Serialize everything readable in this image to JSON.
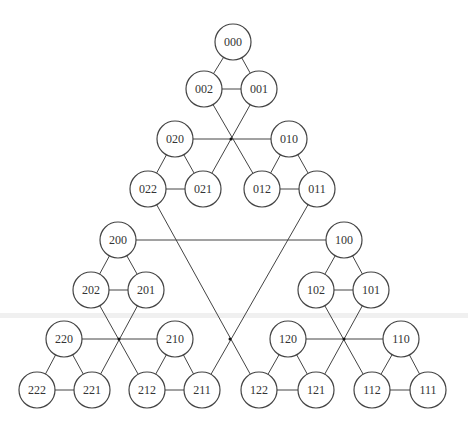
{
  "diagram": {
    "type": "graph",
    "title": "",
    "node_radius": 18,
    "nodes": [
      {
        "id": "000",
        "x": 233,
        "y": 42
      },
      {
        "id": "002",
        "x": 204,
        "y": 89
      },
      {
        "id": "001",
        "x": 259,
        "y": 89
      },
      {
        "id": "020",
        "x": 175,
        "y": 139
      },
      {
        "id": "010",
        "x": 289,
        "y": 139
      },
      {
        "id": "022",
        "x": 148,
        "y": 189
      },
      {
        "id": "021",
        "x": 203,
        "y": 189
      },
      {
        "id": "012",
        "x": 262,
        "y": 189
      },
      {
        "id": "011",
        "x": 317,
        "y": 189
      },
      {
        "id": "200",
        "x": 118,
        "y": 240
      },
      {
        "id": "100",
        "x": 344,
        "y": 240
      },
      {
        "id": "202",
        "x": 91,
        "y": 290
      },
      {
        "id": "201",
        "x": 146,
        "y": 290
      },
      {
        "id": "102",
        "x": 316,
        "y": 290
      },
      {
        "id": "101",
        "x": 371,
        "y": 290
      },
      {
        "id": "220",
        "x": 64,
        "y": 339
      },
      {
        "id": "210",
        "x": 175,
        "y": 339
      },
      {
        "id": "120",
        "x": 288,
        "y": 339
      },
      {
        "id": "110",
        "x": 401,
        "y": 339
      },
      {
        "id": "222",
        "x": 37,
        "y": 390
      },
      {
        "id": "221",
        "x": 92,
        "y": 390
      },
      {
        "id": "212",
        "x": 147,
        "y": 390
      },
      {
        "id": "211",
        "x": 202,
        "y": 390
      },
      {
        "id": "122",
        "x": 259,
        "y": 390
      },
      {
        "id": "121",
        "x": 316,
        "y": 390
      },
      {
        "id": "112",
        "x": 372,
        "y": 390
      },
      {
        "id": "111",
        "x": 428,
        "y": 390
      }
    ],
    "edges": [
      [
        "000",
        "002"
      ],
      [
        "000",
        "001"
      ],
      [
        "002",
        "001"
      ],
      [
        "002",
        "012"
      ],
      [
        "001",
        "021"
      ],
      [
        "020",
        "010"
      ],
      [
        "020",
        "022"
      ],
      [
        "020",
        "021"
      ],
      [
        "022",
        "021"
      ],
      [
        "010",
        "012"
      ],
      [
        "010",
        "011"
      ],
      [
        "012",
        "011"
      ],
      [
        "022",
        "122"
      ],
      [
        "011",
        "211"
      ],
      [
        "200",
        "100"
      ],
      [
        "200",
        "202"
      ],
      [
        "200",
        "201"
      ],
      [
        "202",
        "201"
      ],
      [
        "100",
        "102"
      ],
      [
        "100",
        "101"
      ],
      [
        "102",
        "101"
      ],
      [
        "202",
        "212"
      ],
      [
        "201",
        "221"
      ],
      [
        "220",
        "210"
      ],
      [
        "102",
        "112"
      ],
      [
        "101",
        "121"
      ],
      [
        "120",
        "110"
      ],
      [
        "220",
        "222"
      ],
      [
        "220",
        "221"
      ],
      [
        "222",
        "221"
      ],
      [
        "210",
        "212"
      ],
      [
        "210",
        "211"
      ],
      [
        "212",
        "211"
      ],
      [
        "120",
        "122"
      ],
      [
        "120",
        "121"
      ],
      [
        "122",
        "121"
      ],
      [
        "110",
        "112"
      ],
      [
        "110",
        "111"
      ],
      [
        "112",
        "111"
      ]
    ],
    "crossing_dots": [
      {
        "x": 231,
        "y": 139
      },
      {
        "x": 119,
        "y": 339
      },
      {
        "x": 344,
        "y": 339
      },
      {
        "x": 230,
        "y": 339
      }
    ]
  }
}
